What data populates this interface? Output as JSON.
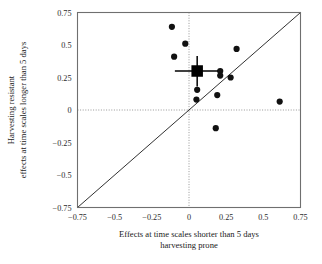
{
  "chart_data": {
    "type": "scatter",
    "title": "",
    "xlabel": "Effects at time scales shorter than 5 days harvesting prone",
    "xlabel_lines": [
      "Effects at time scales shorter than 5 days",
      "harvesting prone"
    ],
    "ylabel": "Harvesting resistant effects at time scales longer than 5 days",
    "ylabel_lines": [
      "Harvesting resistant",
      "effects at time scales longer than 5 days"
    ],
    "xlim": [
      -0.75,
      0.75
    ],
    "ylim": [
      -0.75,
      0.75
    ],
    "xticks": [
      -0.75,
      -0.5,
      -0.25,
      0,
      0.25,
      0.5,
      0.75
    ],
    "yticks": [
      -0.75,
      -0.5,
      -0.25,
      0,
      0.25,
      0.5,
      0.75
    ],
    "xtick_labels": [
      "-0.75",
      "-0.5",
      "-0.25",
      "0",
      "0.25",
      "0.5",
      "0.75"
    ],
    "ytick_labels": [
      "-0.75",
      "-0.5",
      "-0.25",
      "0",
      "0.25",
      "0.5",
      "0.75"
    ],
    "grid": false,
    "zero_lines": true,
    "identity_line": {
      "from": [
        -0.75,
        -0.75
      ],
      "to": [
        0.75,
        0.75
      ]
    },
    "legend": null,
    "point_color": "#111111",
    "marker_color": "#000000",
    "points": [
      {
        "x": -0.115,
        "y": 0.64
      },
      {
        "x": -0.025,
        "y": 0.51
      },
      {
        "x": -0.1,
        "y": 0.41
      },
      {
        "x": 0.32,
        "y": 0.47
      },
      {
        "x": 0.21,
        "y": 0.3
      },
      {
        "x": 0.21,
        "y": 0.265
      },
      {
        "x": 0.28,
        "y": 0.25
      },
      {
        "x": 0.055,
        "y": 0.155
      },
      {
        "x": 0.19,
        "y": 0.115
      },
      {
        "x": 0.05,
        "y": 0.08
      },
      {
        "x": 0.61,
        "y": 0.065
      },
      {
        "x": 0.18,
        "y": -0.14
      }
    ],
    "mean_marker": {
      "x": 0.055,
      "y": 0.3,
      "shape": "square",
      "xerr": [
        -0.095,
        0.195
      ],
      "yerr": [
        0.18,
        0.415
      ]
    }
  }
}
